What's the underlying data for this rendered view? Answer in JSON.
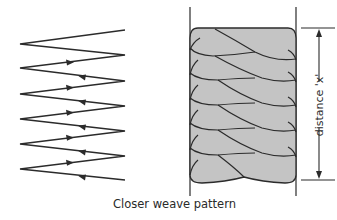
{
  "figure": {
    "caption": "Closer weave pattern",
    "dimension_label": "distance 'x'"
  },
  "colors": {
    "line": "#2b2b2b",
    "weave_fill": "#c4c4c4",
    "background": "#ffffff"
  },
  "zigzag": {
    "description": "Electrode travel path with direction arrows",
    "vertices": [
      [
        125,
        30
      ],
      [
        20,
        44
      ],
      [
        125,
        55
      ],
      [
        20,
        68
      ],
      [
        125,
        81
      ],
      [
        20,
        94
      ],
      [
        125,
        106
      ],
      [
        20,
        119
      ],
      [
        125,
        131
      ],
      [
        20,
        144
      ],
      [
        125,
        156
      ],
      [
        20,
        169
      ],
      [
        125,
        180
      ]
    ]
  },
  "weave": {
    "ripple_count": 7,
    "bounds": {
      "x1": 190,
      "x2": 296,
      "y1": 28,
      "y2": 183
    }
  }
}
